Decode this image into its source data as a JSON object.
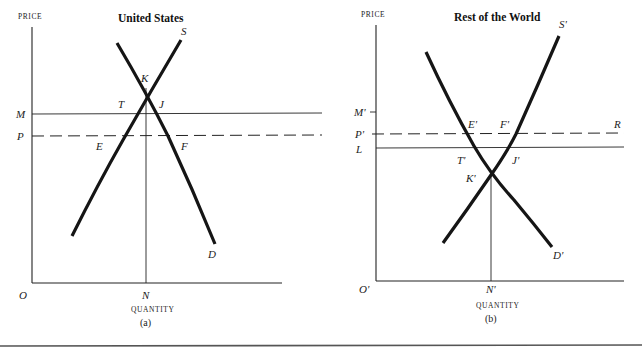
{
  "figure": {
    "panels": [
      {
        "id": "a",
        "title": "United States",
        "caption": "(a)",
        "y_axis_label": "PRICE",
        "x_axis_label": "QUANTITY",
        "origin_label": "O",
        "quantity_mark": "N",
        "price_levels": [
          {
            "label": "M",
            "style": "solid"
          },
          {
            "label": "P",
            "style": "dashed"
          }
        ],
        "curves": [
          {
            "label": "S",
            "kind": "supply"
          },
          {
            "label": "D",
            "kind": "demand"
          }
        ],
        "points": [
          "K",
          "T",
          "J",
          "E",
          "F"
        ]
      },
      {
        "id": "b",
        "title": "Rest of the World",
        "caption": "(b)",
        "y_axis_label": "PRICE",
        "x_axis_label": "QUANTITY",
        "origin_label": "O'",
        "quantity_mark": "N'",
        "price_levels": [
          {
            "label": "M'",
            "style": "solid"
          },
          {
            "label": "P'",
            "style": "dashed",
            "end_label": "R"
          },
          {
            "label": "L",
            "style": "solid"
          }
        ],
        "curves": [
          {
            "label": "S'",
            "kind": "supply"
          },
          {
            "label": "D'",
            "kind": "demand"
          }
        ],
        "points": [
          "K'",
          "T'",
          "J'",
          "E'",
          "F'"
        ]
      }
    ]
  },
  "labels": {
    "a": {
      "price": "PRICE",
      "title": "United States",
      "S": "S",
      "D": "D",
      "K": "K",
      "T": "T",
      "J": "J",
      "E": "E",
      "F": "F",
      "M": "M",
      "P": "P",
      "O": "O",
      "N": "N",
      "quantity": "QUANTITY",
      "caption": "(a)"
    },
    "b": {
      "price": "PRICE",
      "title": "Rest of the World",
      "S": "S'",
      "D": "D'",
      "K": "K'",
      "T": "T'",
      "J": "J'",
      "E": "E'",
      "F": "F'",
      "M": "M'",
      "P": "P'",
      "L": "L",
      "R": "R",
      "O": "O'",
      "N": "N'",
      "quantity": "QUANTITY",
      "caption": "(b)"
    }
  }
}
